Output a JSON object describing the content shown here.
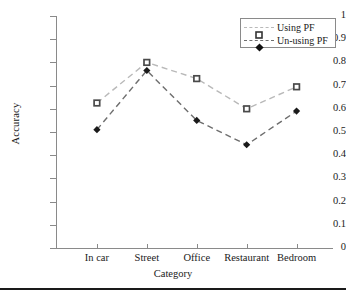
{
  "chart_data": {
    "type": "line",
    "title": "",
    "xlabel": "Category",
    "ylabel": "Accuracy",
    "categories": [
      "In car",
      "Street",
      "Office",
      "Restaurant",
      "Bedroom"
    ],
    "ylim": [
      0,
      1
    ],
    "xlim_padding": true,
    "grid": false,
    "legend_position": "top-right",
    "ytick_labels": [
      "1",
      "0.9",
      "0.8",
      "0.7",
      "0.6",
      "0.5",
      "0.4",
      "0.3",
      "0.2",
      "0.1",
      "0"
    ],
    "ytick_values": [
      1,
      0.9,
      0.8,
      0.7,
      0.6,
      0.5,
      0.4,
      0.3,
      0.2,
      0.1,
      0
    ],
    "series": [
      {
        "name": "Using PF",
        "marker": "square",
        "linestyle": "dashed",
        "color": "#b9b9b9",
        "marker_color": "#4a4a4a",
        "values": [
          0.625,
          0.8,
          0.73,
          0.6,
          0.695
        ]
      },
      {
        "name": "Un-using PF",
        "marker": "diamond",
        "linestyle": "dashed",
        "color": "#6e6e6e",
        "marker_color": "#1a1a1a",
        "values": [
          0.51,
          0.765,
          0.55,
          0.445,
          0.59
        ]
      }
    ]
  },
  "legend": {
    "items": [
      {
        "label": "Using PF"
      },
      {
        "label": "Un-using PF"
      }
    ]
  },
  "axes": {
    "y_title": "Accuracy",
    "x_title": "Category"
  }
}
